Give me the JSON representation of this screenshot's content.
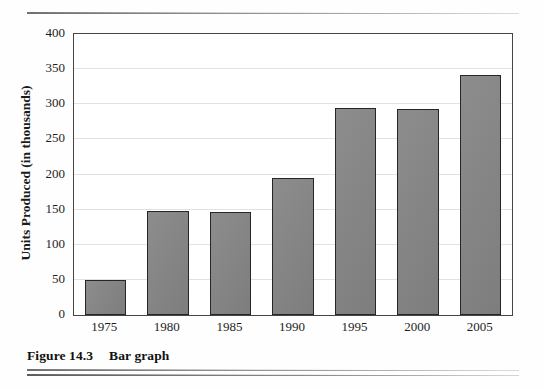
{
  "figure": {
    "caption_label": "Figure 14.3",
    "caption_title": "Bar graph"
  },
  "chart_data": {
    "type": "bar",
    "title": "",
    "subtitle": "",
    "xlabel": "",
    "ylabel": "Units Produced (in thousands)",
    "categories": [
      "1975",
      "1980",
      "1985",
      "1990",
      "1995",
      "2000",
      "2005"
    ],
    "values": [
      50,
      148,
      147,
      195,
      294,
      293,
      341
    ],
    "series": [
      {
        "name": "Units Produced",
        "values": [
          50,
          148,
          147,
          195,
          294,
          293,
          341
        ]
      }
    ],
    "ylim": [
      0,
      400
    ],
    "ytick_values": [
      0,
      50,
      100,
      150,
      200,
      250,
      300,
      350,
      400
    ],
    "ytick_labels": [
      "0",
      "50",
      "100",
      "150",
      "200",
      "250",
      "300",
      "350",
      "400"
    ],
    "xtick_labels": [
      "1975",
      "1980",
      "1985",
      "1990",
      "1995",
      "2000",
      "2005"
    ],
    "grid": "horizontal",
    "legend": "none",
    "bar_fill_color": "#848484",
    "bar_edge_color": "#262626",
    "grid_color": "#e2e2e2",
    "axis_color": "#454545",
    "plot_background": "#ffffff"
  }
}
